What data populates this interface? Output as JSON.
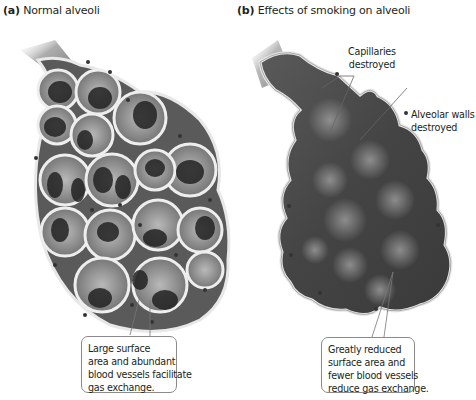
{
  "panels": [
    {
      "id": "a",
      "letter": "(a)",
      "title": "Normal alveoli",
      "callout_box": {
        "lines": [
          "Large surface",
          "area and abundant",
          "blood vessels facilitate",
          "gas exchange."
        ]
      }
    },
    {
      "id": "b",
      "letter": "(b)",
      "title": "Effects of smoking on alveoli",
      "labels": [
        {
          "lines": [
            "Capillaries",
            "destroyed"
          ]
        },
        {
          "lines": [
            "Alveolar walls",
            "destroyed"
          ]
        }
      ],
      "callout_box": {
        "lines": [
          "Greatly reduced",
          "surface area and",
          "fewer blood vessels",
          "reduce gas exchange."
        ]
      }
    }
  ],
  "colors": {
    "text": "#231f20",
    "outline": "#8a8a8a",
    "tissue_dark": "#3a3a3a",
    "tissue_mid": "#7a7a7a",
    "wall_light": "#e6e6e6"
  }
}
